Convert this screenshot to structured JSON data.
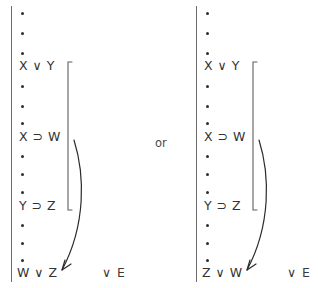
{
  "diagram": {
    "title_visible": false,
    "connector_word": "or",
    "ink_color": "#3a3a3a",
    "bar_color": "#6b6b6b",
    "arrow_color": "#2b2b2b",
    "columns": [
      {
        "id": "left",
        "rows": [
          {
            "kind": "dots",
            "text": "•"
          },
          {
            "kind": "dots",
            "text": "•"
          },
          {
            "kind": "dots",
            "text": "•"
          },
          {
            "kind": "formula",
            "text": "X ∨ Y"
          },
          {
            "kind": "dots",
            "text": "•"
          },
          {
            "kind": "dots",
            "text": "•"
          },
          {
            "kind": "dots",
            "text": "•"
          },
          {
            "kind": "formula",
            "text": "X ⊃ W"
          },
          {
            "kind": "dots",
            "text": "•"
          },
          {
            "kind": "dots",
            "text": "•"
          },
          {
            "kind": "dots",
            "text": "•"
          },
          {
            "kind": "formula",
            "text": "Y ⊃ Z"
          },
          {
            "kind": "dots",
            "text": "•"
          },
          {
            "kind": "dots",
            "text": "•"
          },
          {
            "kind": "dots",
            "text": "•"
          },
          {
            "kind": "formula",
            "text": "W ∨ Z"
          }
        ],
        "conclusion": "W ∨ Z",
        "rule_label": "∨ E"
      },
      {
        "id": "right",
        "rows": [
          {
            "kind": "dots",
            "text": "•"
          },
          {
            "kind": "dots",
            "text": "•"
          },
          {
            "kind": "dots",
            "text": "•"
          },
          {
            "kind": "formula",
            "text": "X ∨ Y"
          },
          {
            "kind": "dots",
            "text": "•"
          },
          {
            "kind": "dots",
            "text": "•"
          },
          {
            "kind": "dots",
            "text": "•"
          },
          {
            "kind": "formula",
            "text": "X ⊃ W"
          },
          {
            "kind": "dots",
            "text": "•"
          },
          {
            "kind": "dots",
            "text": "•"
          },
          {
            "kind": "dots",
            "text": "•"
          },
          {
            "kind": "formula",
            "text": "Y ⊃ Z"
          },
          {
            "kind": "dots",
            "text": "•"
          },
          {
            "kind": "dots",
            "text": "•"
          },
          {
            "kind": "dots",
            "text": "•"
          },
          {
            "kind": "formula",
            "text": "Z ∨ W"
          }
        ],
        "conclusion": "Z ∨ W",
        "rule_label": "∨ E"
      }
    ]
  }
}
